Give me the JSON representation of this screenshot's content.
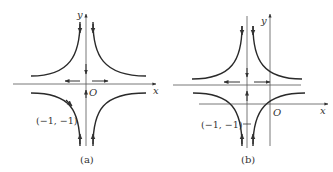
{
  "panels": [
    {
      "id": "a",
      "caption": "(a)",
      "axis_x_label": "x",
      "axis_y_label": "y",
      "origin_label": "O",
      "point_label": "(−1, −1)"
    },
    {
      "id": "b",
      "caption": "(b)",
      "axis_x_label": "x",
      "axis_y_label": "y",
      "origin_label": "O",
      "point_label": "(−1, −1)"
    }
  ],
  "colors": {
    "curve": "#2a2a2a",
    "axis": "#555555",
    "text": "#333333"
  }
}
